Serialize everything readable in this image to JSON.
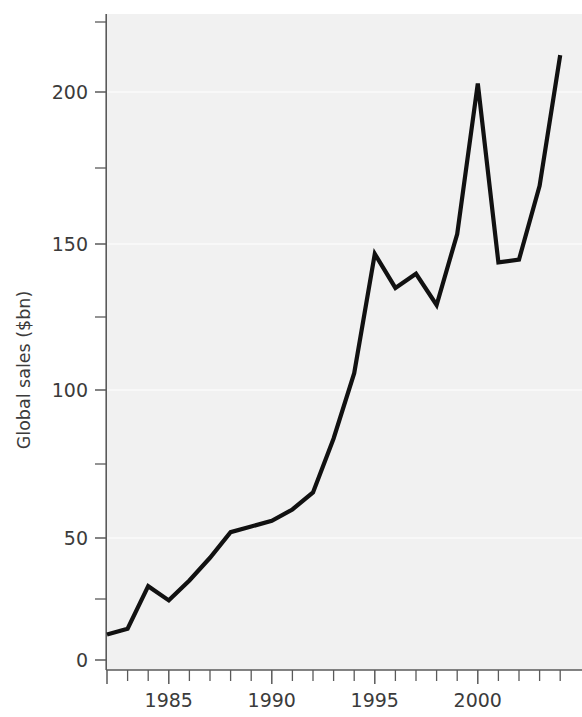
{
  "chart_data": {
    "type": "line",
    "title": "",
    "subtitle": "",
    "xlabel": "",
    "ylabel": "Global sales ($bn)",
    "x": [
      1982,
      1983,
      1984,
      1985,
      1986,
      1987,
      1988,
      1989,
      1990,
      1991,
      1992,
      1993,
      1994,
      1995,
      1996,
      1997,
      1998,
      1999,
      2000,
      2001,
      2002,
      2003,
      2004
    ],
    "values": [
      9,
      11,
      26,
      21,
      28,
      36,
      45,
      47,
      49,
      53,
      59,
      78,
      101,
      143,
      131,
      136,
      125,
      150,
      203,
      140,
      141,
      167,
      213
    ],
    "series": [
      {
        "name": "Global sales",
        "values": [
          9,
          11,
          26,
          21,
          28,
          36,
          45,
          47,
          49,
          53,
          59,
          78,
          101,
          143,
          131,
          136,
          125,
          150,
          203,
          140,
          141,
          167,
          213
        ]
      }
    ],
    "xlim": [
      1982,
      2004
    ],
    "ylim": [
      0,
      225
    ],
    "ytick_values": [
      0,
      50,
      100,
      150,
      200
    ],
    "ytick_labels": [
      "0",
      "50",
      "100",
      "150",
      "200"
    ],
    "yminor_values": [
      25,
      75,
      125,
      175
    ],
    "xtick_values": [
      1982,
      1983,
      1984,
      1985,
      1986,
      1987,
      1988,
      1989,
      1990,
      1991,
      1992,
      1993,
      1994,
      1995,
      1996,
      1997,
      1998,
      1999,
      2000,
      2001,
      2002,
      2003,
      2004
    ],
    "xtick_labeled": [
      1985,
      1990,
      1995,
      2000
    ],
    "xtick_labels": [
      "1985",
      "1990",
      "1995",
      "2000"
    ],
    "grid": true,
    "legend": "none",
    "line_color": "#111111",
    "plot_background": "#f1f1f1",
    "annotations": []
  },
  "axis": {
    "y_title": "Global sales ($bn)",
    "y_labels": {
      "t0": "0",
      "t50": "50",
      "t100": "100",
      "t150": "150",
      "t200": "200"
    },
    "x_labels": {
      "y1985": "1985",
      "y1990": "1990",
      "y1995": "1995",
      "y2000": "2000"
    }
  }
}
